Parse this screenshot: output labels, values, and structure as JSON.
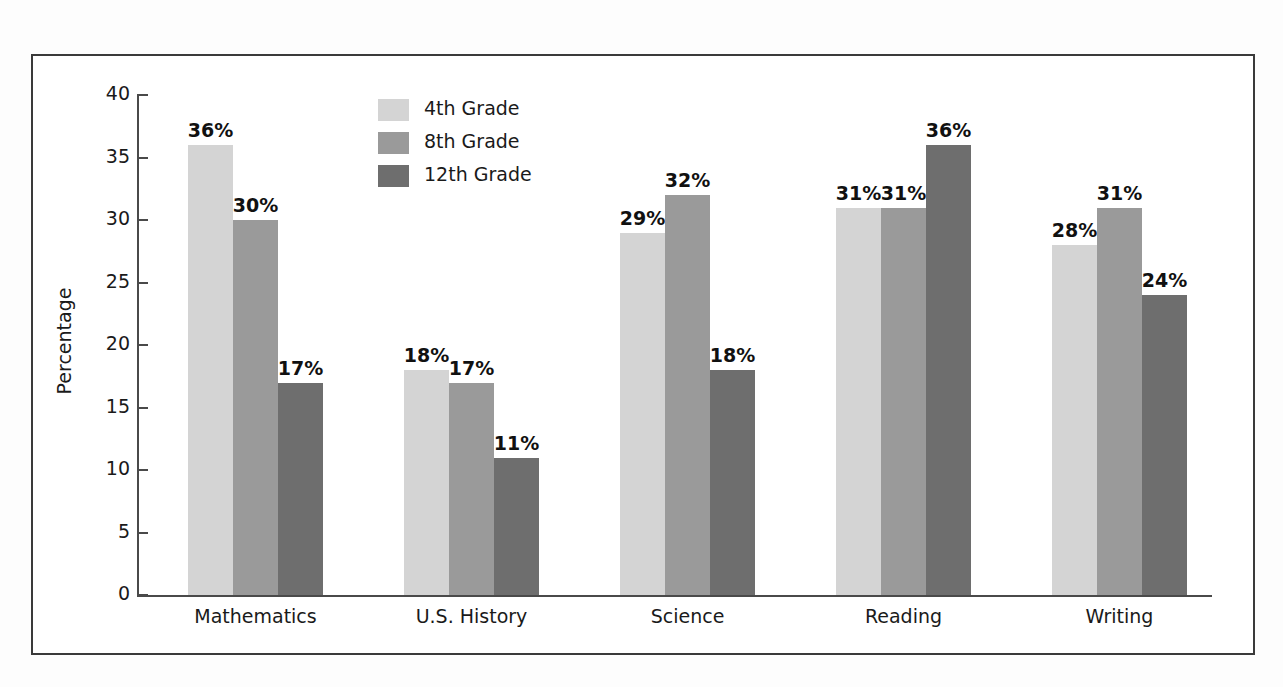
{
  "chart_data": {
    "type": "bar",
    "title": "",
    "subtitle": "",
    "xlabel": "",
    "ylabel": "Percentage",
    "ylim": [
      0,
      40
    ],
    "yticks": [
      0,
      5,
      10,
      15,
      20,
      25,
      30,
      35,
      40
    ],
    "ytick_labels": [
      "0",
      "5",
      "10",
      "15",
      "20",
      "25",
      "30",
      "35",
      "40"
    ],
    "grid": false,
    "legend_position": "upper-left-inside",
    "categories": [
      "Mathematics",
      "U.S. History",
      "Science",
      "Reading",
      "Writing"
    ],
    "series": [
      {
        "name": "4th Grade",
        "color": "#d4d4d4",
        "values": [
          36,
          18,
          29,
          31,
          28
        ],
        "data_labels": [
          "36%",
          "18%",
          "29%",
          "31%",
          "28%"
        ]
      },
      {
        "name": "8th Grade",
        "color": "#9a9a9a",
        "values": [
          30,
          17,
          32,
          31,
          31
        ],
        "data_labels": [
          "30%",
          "17%",
          "32%",
          "31%",
          "31%"
        ]
      },
      {
        "name": "12th Grade",
        "color": "#6e6e6e",
        "values": [
          17,
          11,
          18,
          36,
          24
        ],
        "data_labels": [
          "17%",
          "11%",
          "18%",
          "36%",
          "24%"
        ]
      }
    ]
  },
  "legend": {
    "items": [
      {
        "label": "4th Grade",
        "color": "#d4d4d4"
      },
      {
        "label": "8th Grade",
        "color": "#9a9a9a"
      },
      {
        "label": "12th Grade",
        "color": "#6e6e6e"
      }
    ]
  },
  "axis": {
    "y_title": "Percentage"
  },
  "colors": {
    "frame": "#3a3a3a",
    "axis": "#4a4a4a",
    "text": "#1a1a1a",
    "background": "#ffffff"
  }
}
